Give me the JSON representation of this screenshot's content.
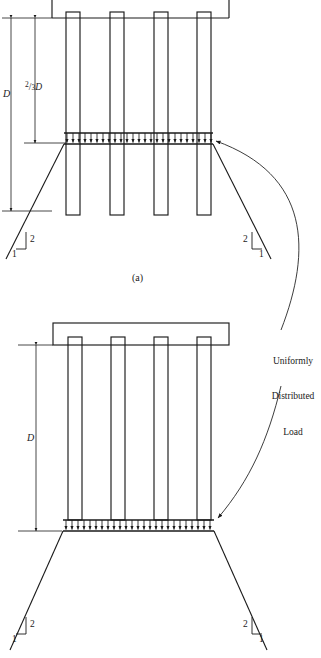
{
  "figure": {
    "type": "engineering-diagram",
    "background_color": "#ffffff",
    "line_color": "#1a1a1a"
  },
  "subfigure_a": {
    "caption": "(a)",
    "depth_label_full": "D",
    "depth_label_partial_numerator": "2",
    "depth_label_partial_denominator": "3",
    "depth_label_partial_suffix": "D",
    "pile_count": 4,
    "slope_vertical": "2",
    "slope_horizontal": "1",
    "slope_vertical_right": "2",
    "slope_horizontal_right": "1"
  },
  "subfigure_b": {
    "depth_label_full": "D",
    "pile_count": 4,
    "slope_vertical": "2",
    "slope_horizontal": "1",
    "slope_vertical_right": "2",
    "slope_horizontal_right": "1"
  },
  "annotation": {
    "line1": "Uniformly",
    "line2": "Distributed",
    "line3": "Load"
  }
}
